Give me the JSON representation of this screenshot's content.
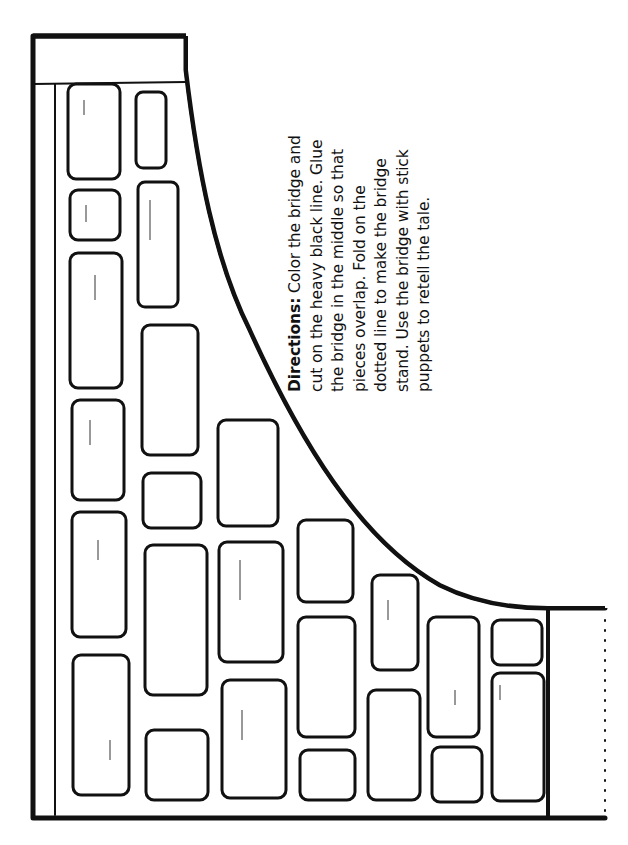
{
  "worksheet": {
    "directions": {
      "label": "Directions:",
      "lines": [
        " Color the bridge and",
        "cut on the heavy black line.  Glue",
        "the bridge in the middle so that",
        "pieces overlap.  Fold on the",
        "dotted line to make the bridge",
        "stand.  Use the bridge with stick",
        "puppets to retell the tale."
      ]
    },
    "illustration": "bridge-cutout-stone-wall",
    "colors": {
      "ink": "#111111",
      "paper": "#ffffff",
      "stipple": "#555555"
    }
  }
}
